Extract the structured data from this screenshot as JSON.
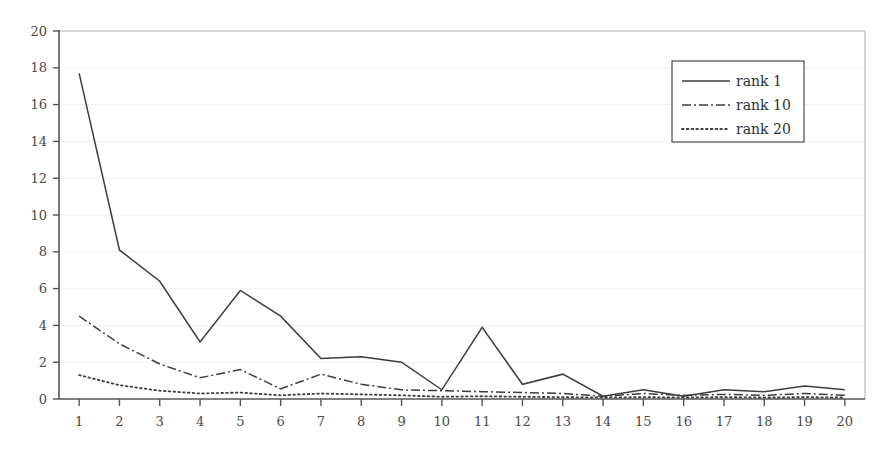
{
  "chart_data": {
    "type": "line",
    "title": "",
    "xlabel": "",
    "ylabel": "",
    "xlim": [
      1,
      20
    ],
    "ylim": [
      0,
      20
    ],
    "grid": true,
    "legend_position": "top-right",
    "categories": [
      1,
      2,
      3,
      4,
      5,
      6,
      7,
      8,
      9,
      10,
      11,
      12,
      13,
      14,
      15,
      16,
      17,
      18,
      19,
      20
    ],
    "x_tick_labels": [
      "1",
      "2",
      "3",
      "4",
      "5",
      "6",
      "7",
      "8",
      "9",
      "10",
      "11",
      "12",
      "13",
      "14",
      "15",
      "16",
      "17",
      "18",
      "19",
      "20"
    ],
    "y_tick_labels": [
      "0",
      "2",
      "4",
      "6",
      "8",
      "10",
      "12",
      "14",
      "16",
      "18",
      "20"
    ],
    "y_ticks": [
      0,
      2,
      4,
      6,
      8,
      10,
      12,
      14,
      16,
      18,
      20
    ],
    "series": [
      {
        "name": "rank 1",
        "style": "solid",
        "color": "#3d3d3d",
        "values": [
          17.7,
          8.1,
          6.4,
          3.1,
          5.9,
          4.5,
          2.2,
          2.3,
          2.0,
          0.5,
          3.9,
          0.8,
          1.35,
          0.15,
          0.5,
          0.15,
          0.5,
          0.4,
          0.7,
          0.5
        ]
      },
      {
        "name": "rank 10",
        "style": "dash-dot",
        "color": "#3d3d3d",
        "values": [
          4.5,
          3.0,
          1.9,
          1.15,
          1.6,
          0.55,
          1.35,
          0.8,
          0.5,
          0.45,
          0.4,
          0.35,
          0.3,
          0.15,
          0.3,
          0.2,
          0.25,
          0.2,
          0.3,
          0.2
        ]
      },
      {
        "name": "rank 20",
        "style": "dotted",
        "color": "#3d3d3d",
        "values": [
          1.3,
          0.75,
          0.45,
          0.3,
          0.35,
          0.2,
          0.3,
          0.25,
          0.2,
          0.12,
          0.15,
          0.12,
          0.1,
          0.08,
          0.1,
          0.08,
          0.1,
          0.08,
          0.1,
          0.08
        ]
      }
    ]
  },
  "legend": {
    "items": [
      {
        "label": "rank 1",
        "style": "solid"
      },
      {
        "label": "rank 10",
        "style": "dash-dot"
      },
      {
        "label": "rank 20",
        "style": "dotted"
      }
    ]
  },
  "colors": {
    "axis": "#555555",
    "grid": "#f0f0f0",
    "plot_border": "#b8b8b8",
    "line": "#3d3d3d",
    "tick_text": "#4a4a4a"
  }
}
